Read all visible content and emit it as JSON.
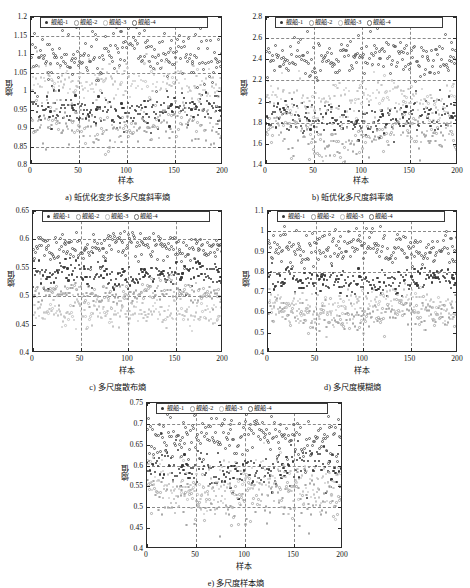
{
  "figure": {
    "legend_labels": [
      "舰船-1",
      "舰船-2",
      "舰船-3",
      "舰船-4"
    ],
    "xlabel": "样本",
    "ylabel": "熵值"
  },
  "chart_data": [
    {
      "type": "scatter",
      "panel": "a",
      "title": "a) 蚯优化变步长多尺度斜率熵",
      "xlabel": "样本",
      "ylabel": "熵值",
      "xlim": [
        0,
        200
      ],
      "ylim": [
        0.8,
        1.2
      ],
      "xticks": [
        0,
        50,
        100,
        150,
        200
      ],
      "yticks": [
        0.8,
        0.85,
        0.9,
        0.95,
        1,
        1.05,
        1.1,
        1.15,
        1.2
      ],
      "grid": true,
      "gridlines_y": [
        0.85,
        1.05,
        1.15
      ],
      "gridlines_x": [
        50,
        100,
        150
      ],
      "legend_position": "top",
      "series": [
        {
          "name": "舰船-1",
          "center": 0.945,
          "spread": 0.022,
          "color": "#3a3a3a",
          "marker": "filled-dot",
          "n": 200
        },
        {
          "name": "舰船-2",
          "center": 0.905,
          "spread": 0.028,
          "color": "#a8a8a8",
          "marker": "open-circle",
          "n": 200
        },
        {
          "name": "舰船-3",
          "center": 1.03,
          "spread": 0.03,
          "color": "#c6c6c6",
          "marker": "open-circle",
          "n": 200
        },
        {
          "name": "舰船-4",
          "center": 1.095,
          "spread": 0.035,
          "color": "#5e5e5e",
          "marker": "open-circle",
          "n": 200
        }
      ]
    },
    {
      "type": "scatter",
      "panel": "b",
      "title": "b) 蚯优化多尺度斜率熵",
      "xlabel": "样本",
      "ylabel": "熵值",
      "xlim": [
        0,
        200
      ],
      "ylim": [
        1.4,
        2.8
      ],
      "xticks": [
        0,
        50,
        100,
        150,
        200
      ],
      "yticks": [
        1.4,
        1.6,
        1.8,
        2,
        2.2,
        2.4,
        2.6,
        2.8
      ],
      "grid": true,
      "gridlines_y": [
        1.8,
        2.2,
        2.6
      ],
      "gridlines_x": [
        50,
        100,
        150
      ],
      "legend_position": "top",
      "series": [
        {
          "name": "舰船-1",
          "center": 1.83,
          "spread": 0.085,
          "color": "#3a3a3a",
          "marker": "filled-dot",
          "n": 200
        },
        {
          "name": "舰船-2",
          "center": 1.68,
          "spread": 0.095,
          "color": "#a8a8a8",
          "marker": "open-circle",
          "n": 200
        },
        {
          "name": "舰船-3",
          "center": 2.01,
          "spread": 0.11,
          "color": "#c6c6c6",
          "marker": "open-circle",
          "n": 200
        },
        {
          "name": "舰船-4",
          "center": 2.43,
          "spread": 0.095,
          "color": "#5e5e5e",
          "marker": "open-circle",
          "n": 200
        }
      ]
    },
    {
      "type": "scatter",
      "panel": "c",
      "title": "c) 多尺度散布熵",
      "xlabel": "样本",
      "ylabel": "熵值",
      "xlim": [
        0,
        200
      ],
      "ylim": [
        0.4,
        0.65
      ],
      "xticks": [
        0,
        50,
        100,
        150,
        200
      ],
      "yticks": [
        0.4,
        0.45,
        0.5,
        0.55,
        0.6,
        0.65
      ],
      "grid": true,
      "gridlines_y": [
        0.5,
        0.6
      ],
      "gridlines_x": [
        50,
        100,
        150
      ],
      "legend_position": "top",
      "series": [
        {
          "name": "舰船-1",
          "center": 0.538,
          "spread": 0.013,
          "color": "#3a3a3a",
          "marker": "filled-dot",
          "n": 200
        },
        {
          "name": "舰船-2",
          "center": 0.505,
          "spread": 0.01,
          "color": "#a8a8a8",
          "marker": "open-circle",
          "n": 200
        },
        {
          "name": "舰船-3",
          "center": 0.472,
          "spread": 0.014,
          "color": "#c6c6c6",
          "marker": "open-circle",
          "n": 200
        },
        {
          "name": "舰船-4",
          "center": 0.589,
          "spread": 0.013,
          "color": "#5e5e5e",
          "marker": "open-circle",
          "n": 200
        }
      ]
    },
    {
      "type": "scatter",
      "panel": "d",
      "title": "d) 多尺度模糊熵",
      "xlabel": "样本",
      "ylabel": "熵值",
      "xlim": [
        0,
        200
      ],
      "ylim": [
        0.4,
        1.1
      ],
      "xticks": [
        0,
        50,
        100,
        150,
        200
      ],
      "yticks": [
        0.4,
        0.5,
        0.6,
        0.7,
        0.8,
        0.9,
        1,
        1.1
      ],
      "grid": true,
      "gridlines_y": [
        0.8,
        1.0
      ],
      "gridlines_x": [
        50,
        100,
        150
      ],
      "legend_position": "top",
      "series": [
        {
          "name": "舰船-1",
          "center": 0.757,
          "spread": 0.033,
          "color": "#3a3a3a",
          "marker": "filled-dot",
          "n": 200
        },
        {
          "name": "舰船-2",
          "center": 0.588,
          "spread": 0.04,
          "color": "#a8a8a8",
          "marker": "open-circle",
          "n": 200
        },
        {
          "name": "舰船-3",
          "center": 0.633,
          "spread": 0.045,
          "color": "#c6c6c6",
          "marker": "open-circle",
          "n": 200
        },
        {
          "name": "舰船-4",
          "center": 0.917,
          "spread": 0.042,
          "color": "#5e5e5e",
          "marker": "open-circle",
          "n": 200
        }
      ]
    },
    {
      "type": "scatter",
      "panel": "e",
      "title": "e) 多尺度样本熵",
      "xlabel": "样本",
      "ylabel": "熵值",
      "xlim": [
        0,
        200
      ],
      "ylim": [
        0.4,
        0.75
      ],
      "xticks": [
        0,
        50,
        100,
        150,
        200
      ],
      "yticks": [
        0.4,
        0.45,
        0.5,
        0.55,
        0.6,
        0.65,
        0.7,
        0.75
      ],
      "grid": true,
      "gridlines_y": [
        0.5,
        0.6,
        0.7
      ],
      "gridlines_x": [
        50,
        100,
        150
      ],
      "legend_position": "top",
      "series": [
        {
          "name": "舰船-1",
          "center": 0.588,
          "spread": 0.023,
          "color": "#3a3a3a",
          "marker": "filled-dot",
          "n": 200
        },
        {
          "name": "舰船-2",
          "center": 0.523,
          "spread": 0.028,
          "color": "#a8a8a8",
          "marker": "open-circle",
          "n": 200
        },
        {
          "name": "舰船-3",
          "center": 0.556,
          "spread": 0.03,
          "color": "#c6c6c6",
          "marker": "open-circle",
          "n": 200
        },
        {
          "name": "舰船-4",
          "center": 0.668,
          "spread": 0.025,
          "color": "#5e5e5e",
          "marker": "open-circle",
          "n": 200
        }
      ]
    }
  ]
}
